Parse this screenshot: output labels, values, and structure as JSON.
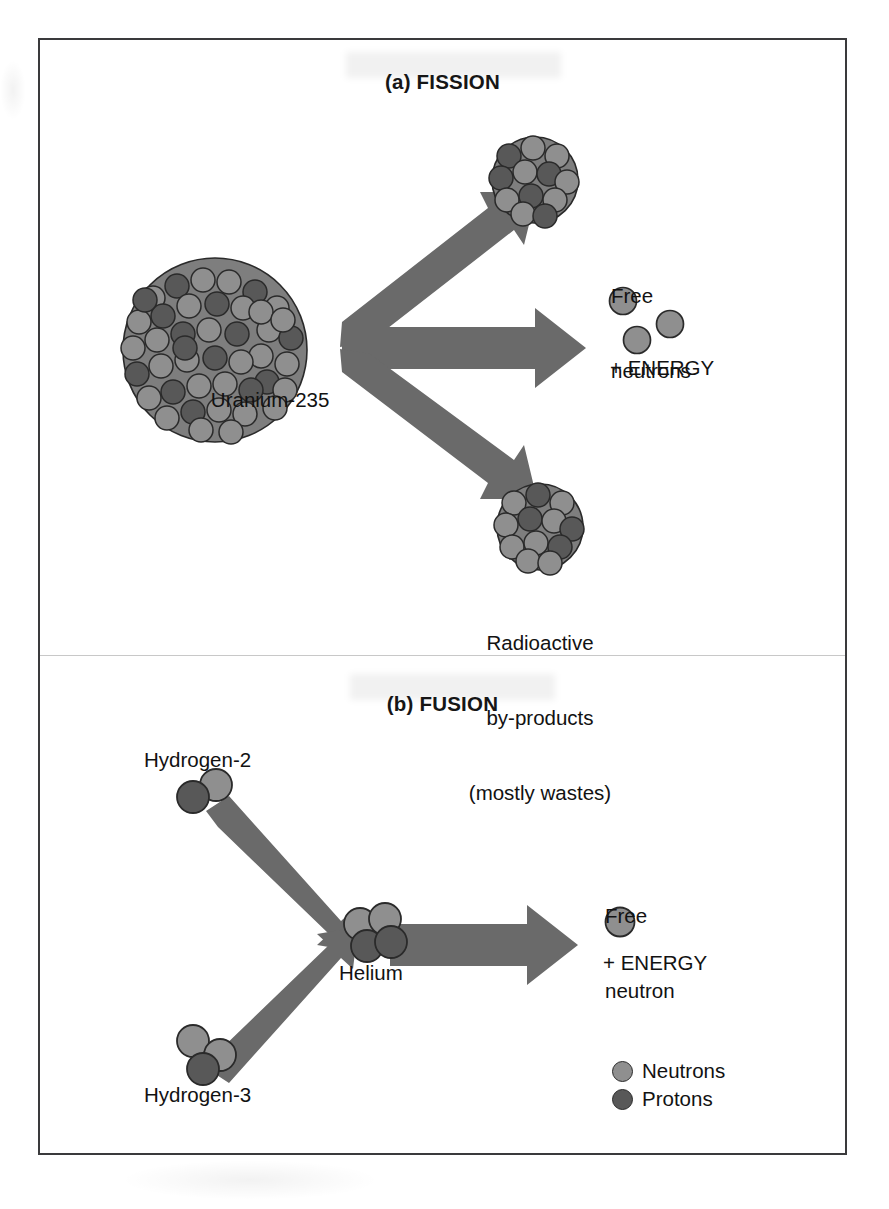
{
  "figure": {
    "caption_a": "(a) FISSION",
    "caption_b": "(b) FUSION"
  },
  "fission": {
    "reactant_label": "Uranium-235",
    "product_top_label": "",
    "free_neutrons_label_line1": "Free",
    "free_neutrons_label_line2": "neutrons",
    "energy_label": "+ ENERGY",
    "byproduct_line1": "Radioactive",
    "byproduct_line2": "by-products",
    "byproduct_line3": "(mostly wastes)",
    "free_neutron_count": 3,
    "arrow_count": 3
  },
  "fusion": {
    "reactant_top_label": "Hydrogen-2",
    "reactant_bottom_label": "Hydrogen-3",
    "product_label": "Helium",
    "free_neutron_label_line1": "Free",
    "free_neutron_label_line2": "neutron",
    "energy_label": "+ ENERGY",
    "free_neutron_count": 1,
    "hydrogen2_nucleons": {
      "protons": 1,
      "neutrons": 1
    },
    "hydrogen3_nucleons": {
      "protons": 1,
      "neutrons": 2
    },
    "helium_nucleons": {
      "protons": 2,
      "neutrons": 2
    }
  },
  "legend": {
    "items": [
      {
        "label": "Neutrons",
        "color": "#8f8f8f"
      },
      {
        "label": "Protons",
        "color": "#585858"
      }
    ]
  },
  "colors": {
    "neutron": "#8f8f8f",
    "proton": "#585858",
    "arrow": "#6a6a6a",
    "outline": "#2a2a2a",
    "frame": "#3a3a3c",
    "divider": "#c8c8c8",
    "text": "#121212",
    "background": "#ffffff"
  }
}
